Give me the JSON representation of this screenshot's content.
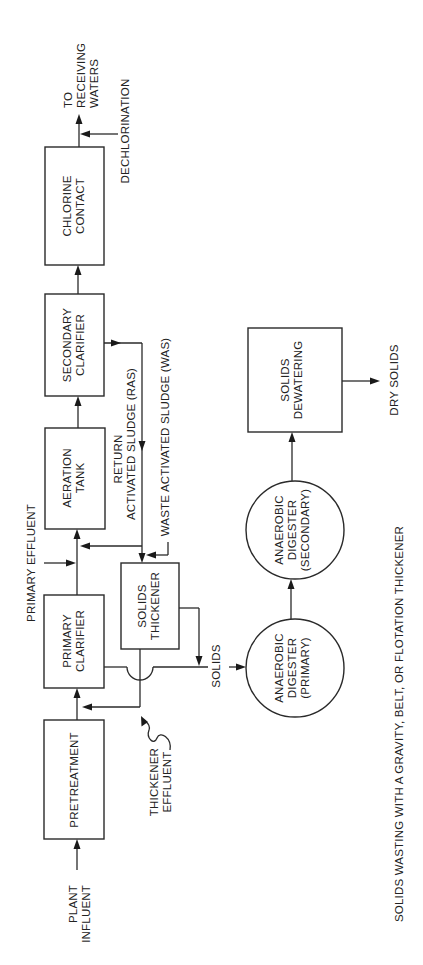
{
  "diagram": {
    "orientation": "rotated 90 degrees counter-clockwise",
    "colors": {
      "line": "#2a2a2a",
      "text": "#222222",
      "background": "#ffffff"
    },
    "inputs": {
      "plant_influent_line1": "PLANT",
      "plant_influent_line2": "INFLUENT"
    },
    "units": {
      "pretreatment": {
        "line1": "PRETREATMENT"
      },
      "primary_clarifier": {
        "line1": "PRIMARY",
        "line2": "CLARIFIER"
      },
      "aeration_tank": {
        "line1": "AERATION",
        "line2": "TANK"
      },
      "secondary_clarifier": {
        "line1": "SECONDARY",
        "line2": "CLARIFIER"
      },
      "chlorine_contact": {
        "line1": "CHLORINE",
        "line2": "CONTACT"
      },
      "solids_thickener": {
        "line1": "SOLIDS",
        "line2": "THICKENER"
      },
      "anaerobic_digester_primary": {
        "line1": "ANAEROBIC",
        "line2": "DIGESTER",
        "line3": "(PRIMARY)"
      },
      "anaerobic_digester_secondary": {
        "line1": "ANAEROBIC",
        "line2": "DIGESTER",
        "line3": "(SECONDARY)"
      },
      "solids_dewatering": {
        "line1": "SOLIDS",
        "line2": "DEWATERING"
      }
    },
    "streams": {
      "primary_effluent": "PRIMARY EFFLUENT",
      "ras_line1": "RETURN",
      "ras_line2": "ACTIVATED SLUDGE (RAS)",
      "was": "WASTE ACTIVATED SLUDGE (WAS)",
      "thickener_effluent_line1": "THICKENER",
      "thickener_effluent_line2": "EFFLUENT",
      "solids": "SOLIDS",
      "dechlorination": "DECHLORINATION",
      "outflow_line1": "TO",
      "outflow_line2": "RECEIVING",
      "outflow_line3": "WATERS",
      "dry_solids": "DRY SOLIDS"
    },
    "footnote": "SOLIDS WASTING WITH A GRAVITY, BELT, OR FLOTATION THICKENER"
  }
}
